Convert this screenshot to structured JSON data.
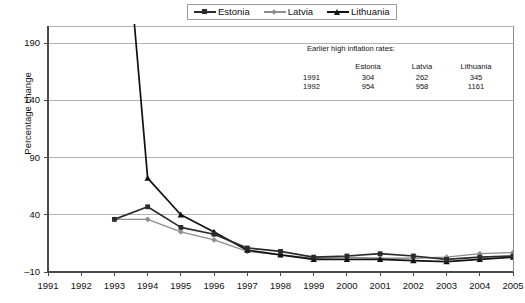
{
  "legend": {
    "position": "top-center",
    "items": [
      {
        "label": "Estonia",
        "marker": "square",
        "color": "#2b2b2b"
      },
      {
        "label": "Latvia",
        "marker": "diamond",
        "color": "#8d8d8d"
      },
      {
        "label": "Lithuania",
        "marker": "triangle",
        "color": "#111111"
      }
    ]
  },
  "annotation": {
    "title": "Earlier high inflation rates:",
    "columns": [
      "",
      "Estonia",
      "Latvia",
      "Lithuania"
    ],
    "rows": [
      {
        "year": "1991",
        "estonia": "304",
        "latvia": "262",
        "lithuania": "345"
      },
      {
        "year": "1992",
        "estonia": "954",
        "latvia": "958",
        "lithuania": "1161"
      }
    ]
  },
  "chart_data": {
    "type": "line",
    "title": "",
    "xlabel": "",
    "ylabel": "Percentage change",
    "x": [
      1991,
      1992,
      1993,
      1994,
      1995,
      1996,
      1997,
      1998,
      1999,
      2000,
      2001,
      2002,
      2003,
      2004,
      2005
    ],
    "xticklabels": [
      "1991",
      "1992",
      "1993",
      "1994",
      "1995",
      "1996",
      "1997",
      "1998",
      "1999",
      "2000",
      "2001",
      "2002",
      "2003",
      "2004",
      "2005"
    ],
    "yticks": [
      -10,
      40,
      90,
      140,
      190
    ],
    "ylim": [
      -10,
      205
    ],
    "xlim": [
      1991,
      2005
    ],
    "grid": true,
    "grid_axis": "y",
    "series": [
      {
        "name": "Estonia",
        "color": "#2b2b2b",
        "marker": "square",
        "x": [
          1993,
          1994,
          1995,
          1996,
          1997,
          1998,
          1999,
          2000,
          2001,
          2002,
          2003,
          2004,
          2005
        ],
        "values": [
          36,
          47,
          29,
          23,
          11,
          8,
          3,
          4,
          6,
          4,
          1,
          3,
          4
        ]
      },
      {
        "name": "Latvia",
        "color": "#8d8d8d",
        "marker": "diamond",
        "x": [
          1993,
          1994,
          1995,
          1996,
          1997,
          1998,
          1999,
          2000,
          2001,
          2002,
          2003,
          2004,
          2005
        ],
        "values": [
          36,
          36,
          25,
          18,
          8,
          5,
          2,
          3,
          2,
          2,
          3,
          6,
          7
        ]
      },
      {
        "name": "Lithuania",
        "color": "#111111",
        "marker": "triangle",
        "x": [
          1993,
          1994,
          1995,
          1996,
          1997,
          1998,
          1999,
          2000,
          2001,
          2002,
          2003,
          2004,
          2005
        ],
        "values": [
          410,
          72,
          40,
          25,
          9,
          5,
          1,
          1,
          1,
          0,
          -1,
          1,
          3
        ]
      }
    ]
  }
}
